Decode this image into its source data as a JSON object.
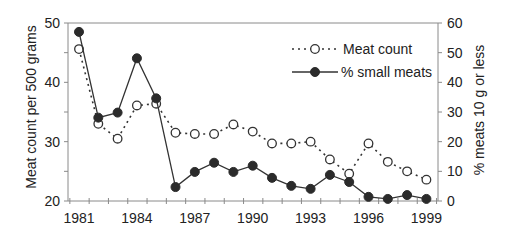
{
  "chart_data": {
    "type": "line",
    "title": "",
    "x": [
      1981,
      1982,
      1983,
      1984,
      1985,
      1986,
      1987,
      1988,
      1989,
      1990,
      1991,
      1992,
      1993,
      1994,
      1995,
      1996,
      1997,
      1998,
      1999
    ],
    "xtick_labels": [
      "1981",
      "1984",
      "1987",
      "1990",
      "1993",
      "1996",
      "1999"
    ],
    "xlabel": "",
    "ylabel": "Meat count per 500 grams",
    "ylim": [
      20,
      50
    ],
    "yticks": [
      20,
      30,
      40,
      50
    ],
    "y2label": "% meats 10 g or less",
    "y2lim": [
      0,
      60
    ],
    "y2ticks": [
      0,
      10,
      20,
      30,
      40,
      50,
      60
    ],
    "grid": false,
    "legend_position": "upper right",
    "series": [
      {
        "name": "Meat count",
        "axis": "left",
        "marker": "open-circle",
        "line_style": "dotted",
        "values": [
          45.6,
          33.0,
          30.5,
          36.1,
          36.4,
          31.5,
          31.3,
          31.3,
          32.9,
          31.7,
          29.7,
          29.7,
          30.0,
          27.0,
          24.6,
          29.7,
          26.6,
          25.0,
          23.6
        ]
      },
      {
        "name": "% small meats",
        "axis": "right",
        "marker": "filled-circle",
        "line_style": "solid",
        "values": [
          57.0,
          28.1,
          29.8,
          48.1,
          34.6,
          4.7,
          9.8,
          12.9,
          9.8,
          11.9,
          7.8,
          5.1,
          4.1,
          8.8,
          6.4,
          1.4,
          0.7,
          2.0,
          0.7
        ]
      }
    ]
  },
  "legend": {
    "items": [
      {
        "label": "Meat count"
      },
      {
        "label": "% small meats"
      }
    ]
  },
  "axes": {
    "left_title": "Meat count per 500 grams",
    "right_title": "% meats 10 g or less"
  },
  "colors": {
    "axis": "#8a8a8a",
    "line": "#333333",
    "marker_fill": "#2b2b2b",
    "open_marker_fill": "#ffffff",
    "text": "#222222"
  }
}
